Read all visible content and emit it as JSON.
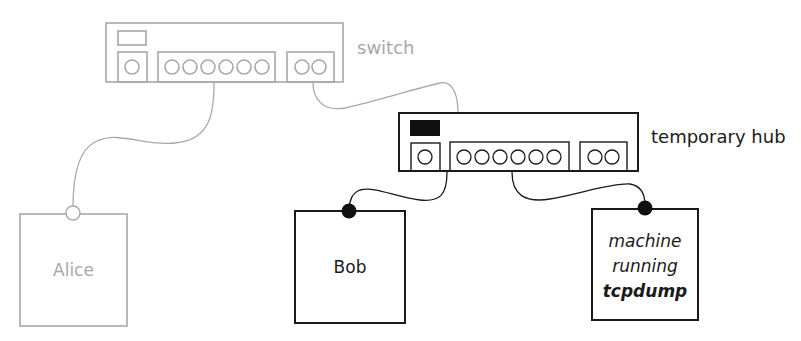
{
  "diagram": {
    "type": "network-topology",
    "colors": {
      "inactive": "#a8a8a8",
      "active": "#1a1a1a",
      "hub_indicator": "#111111"
    },
    "nodes": {
      "switch": {
        "label": "switch",
        "ports": {
          "uplink": 1,
          "main": 6,
          "extra": 2
        }
      },
      "hub": {
        "label": "temporary hub",
        "ports": {
          "uplink": 1,
          "main": 6,
          "extra": 2
        }
      },
      "alice": {
        "label": "Alice",
        "connector": "open-circle"
      },
      "bob": {
        "label": "Bob",
        "connector": "filled-circle"
      },
      "sniffer": {
        "line1": "machine",
        "line2": "running",
        "line3": "tcpdump",
        "connector": "filled-circle"
      }
    },
    "edges": [
      {
        "from": "switch",
        "to": "alice"
      },
      {
        "from": "switch",
        "to": "hub"
      },
      {
        "from": "hub",
        "to": "bob"
      },
      {
        "from": "hub",
        "to": "sniffer"
      }
    ]
  }
}
